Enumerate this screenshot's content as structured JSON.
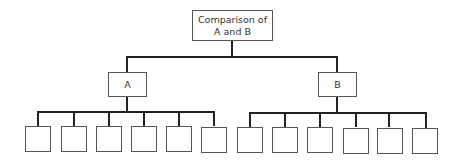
{
  "diagram": {
    "type": "hierarchy-tree",
    "root": {
      "label_line1": "Comparison of",
      "label_line2": "A and B"
    },
    "children": [
      {
        "label": "A",
        "leaf_count": 6,
        "leaves": [
          "",
          "",
          "",
          "",
          "",
          ""
        ]
      },
      {
        "label": "B",
        "leaf_count": 6,
        "leaves": [
          "",
          "",
          "",
          "",
          "",
          ""
        ]
      }
    ],
    "colors": {
      "line": "#222222",
      "box_border": "#555555",
      "text": "#333333",
      "background": "#ffffff"
    }
  }
}
